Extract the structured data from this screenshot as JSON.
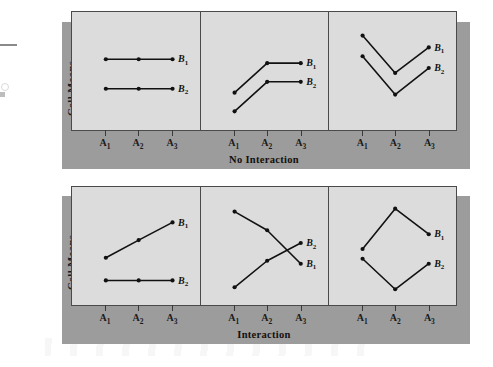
{
  "figure": {
    "y_axis_label": "Cell Means",
    "x_tick_labels": [
      "A",
      "A",
      "A"
    ],
    "x_tick_subs": [
      "1",
      "2",
      "3"
    ],
    "series_labels": [
      "B",
      "B"
    ],
    "series_subs": [
      "1",
      "2"
    ],
    "colors": {
      "panel_fill": "#dcdcdc",
      "block_fill": "#9c9c9c",
      "ink": "#111111",
      "axis": "#4a4a4a",
      "page": "#ffffff"
    }
  },
  "rows": [
    {
      "caption": "No Interaction",
      "y_axis_label": "Cell Means",
      "panels": [
        {
          "name": "no-interaction-parallel-flat",
          "series": [
            {
              "label": "B",
              "sub": "1",
              "values": [
                62,
                62,
                62
              ]
            },
            {
              "label": "B",
              "sub": "2",
              "values": [
                32,
                32,
                32
              ]
            }
          ]
        },
        {
          "name": "no-interaction-parallel-rising",
          "series": [
            {
              "label": "B",
              "sub": "1",
              "values": [
                28,
                58,
                58
              ]
            },
            {
              "label": "B",
              "sub": "2",
              "values": [
                9,
                39,
                39
              ]
            }
          ]
        },
        {
          "name": "no-interaction-parallel-v-shape",
          "series": [
            {
              "label": "B",
              "sub": "1",
              "values": [
                86,
                48,
                74
              ]
            },
            {
              "label": "B",
              "sub": "2",
              "values": [
                65,
                26,
                53
              ]
            }
          ]
        }
      ]
    },
    {
      "caption": "Interaction",
      "y_axis_label": "Cell Means",
      "panels": [
        {
          "name": "interaction-diverging-slopes",
          "series": [
            {
              "label": "B",
              "sub": "1",
              "values": [
                38,
                56,
                74
              ]
            },
            {
              "label": "B",
              "sub": "2",
              "values": [
                15,
                15,
                15
              ]
            }
          ]
        },
        {
          "name": "interaction-crossover",
          "series": [
            {
              "label": "B",
              "sub": "1",
              "values": [
                85,
                66,
                32
              ]
            },
            {
              "label": "B",
              "sub": "2",
              "values": [
                8,
                35,
                53
              ]
            }
          ]
        },
        {
          "name": "interaction-opposing-v-shapes",
          "series": [
            {
              "label": "B",
              "sub": "1",
              "values": [
                47,
                88,
                62
              ]
            },
            {
              "label": "B",
              "sub": "2",
              "values": [
                37,
                6,
                32
              ]
            }
          ]
        }
      ]
    }
  ],
  "chart_data": {
    "type": "line",
    "title": "",
    "xlabel": "",
    "ylabel": "Cell Means",
    "categories": [
      "A1",
      "A2",
      "A3"
    ],
    "ylim": [
      0,
      100
    ],
    "grid": false,
    "legend": "inline-right-end-labels",
    "panels": [
      {
        "row": "No Interaction",
        "position": "top-left",
        "series": [
          {
            "name": "B1",
            "values": [
              62,
              62,
              62
            ]
          },
          {
            "name": "B2",
            "values": [
              32,
              32,
              32
            ]
          }
        ]
      },
      {
        "row": "No Interaction",
        "position": "top-center",
        "series": [
          {
            "name": "B1",
            "values": [
              28,
              58,
              58
            ]
          },
          {
            "name": "B2",
            "values": [
              9,
              39,
              39
            ]
          }
        ]
      },
      {
        "row": "No Interaction",
        "position": "top-right",
        "series": [
          {
            "name": "B1",
            "values": [
              86,
              48,
              74
            ]
          },
          {
            "name": "B2",
            "values": [
              65,
              26,
              53
            ]
          }
        ]
      },
      {
        "row": "Interaction",
        "position": "bottom-left",
        "series": [
          {
            "name": "B1",
            "values": [
              38,
              56,
              74
            ]
          },
          {
            "name": "B2",
            "values": [
              15,
              15,
              15
            ]
          }
        ]
      },
      {
        "row": "Interaction",
        "position": "bottom-center",
        "series": [
          {
            "name": "B1",
            "values": [
              85,
              66,
              32
            ]
          },
          {
            "name": "B2",
            "values": [
              8,
              35,
              53
            ]
          }
        ]
      },
      {
        "row": "Interaction",
        "position": "bottom-right",
        "series": [
          {
            "name": "B1",
            "values": [
              47,
              88,
              62
            ]
          },
          {
            "name": "B2",
            "values": [
              37,
              6,
              32
            ]
          }
        ]
      }
    ]
  }
}
